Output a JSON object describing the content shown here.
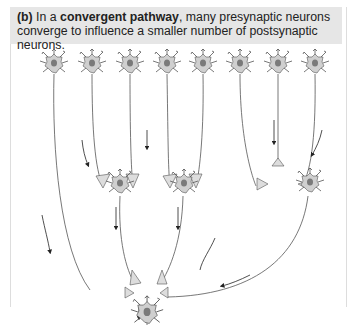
{
  "caption": {
    "label": "(b)",
    "prefix": " In a ",
    "term": "convergent pathway",
    "suffix": ", many presynaptic neurons converge to influence a smaller number of postsynaptic neurons."
  },
  "diagram": {
    "presynaptic_count": 8,
    "intermediate_count": 3,
    "output_count": 1,
    "colors": {
      "soma": "#cfcfcf",
      "nucleus": "#7a7a7a",
      "line": "#555555",
      "caption_bg": "#e6e6e6"
    }
  }
}
